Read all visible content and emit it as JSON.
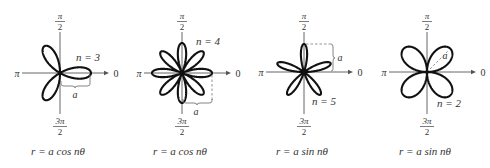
{
  "figure": {
    "angle_labels": {
      "top_num": "π",
      "top_den": "2",
      "bottom_num": "3π",
      "bottom_den": "2",
      "left": "π",
      "right": "0"
    },
    "length_label": "a",
    "plots": [
      {
        "id": "rose-cos-3",
        "equation": "r = a cos nθ",
        "trig": "cos",
        "n": 3,
        "n_label": "n = 3",
        "petals": 3,
        "cx": 60,
        "cy": 73,
        "a": 31
      },
      {
        "id": "rose-cos-4",
        "equation": "r = a cos nθ",
        "trig": "cos",
        "n": 4,
        "n_label": "n = 4",
        "petals": 8,
        "cx": 182,
        "cy": 73,
        "a": 30
      },
      {
        "id": "rose-sin-5",
        "equation": "r = a sin nθ",
        "trig": "sin",
        "n": 5,
        "n_label": "n = 5",
        "petals": 5,
        "cx": 304,
        "cy": 72,
        "a": 28
      },
      {
        "id": "rose-sin-2",
        "equation": "r = a sin nθ",
        "trig": "sin",
        "n": 2,
        "n_label": "n = 2",
        "petals": 4,
        "cx": 427,
        "cy": 72,
        "a": 33
      }
    ]
  },
  "colors": {
    "curve": "#111111",
    "axis": "#555555",
    "label": "#333333",
    "dashed": "#888888",
    "background": "#ffffff"
  }
}
